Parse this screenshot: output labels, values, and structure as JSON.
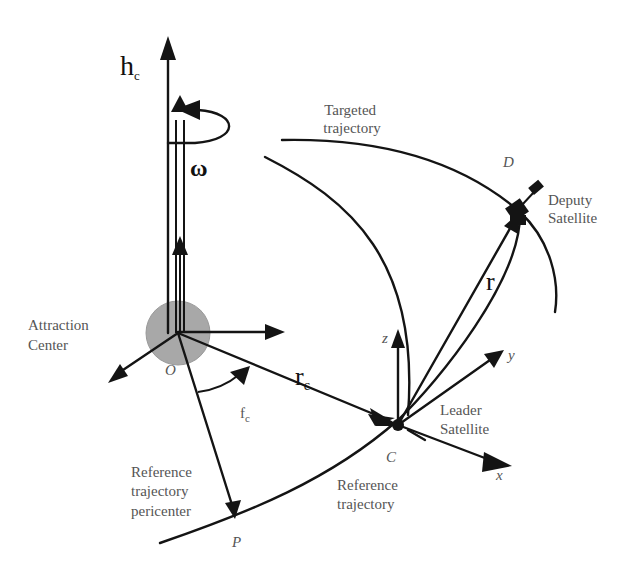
{
  "diagram": {
    "colors": {
      "ink": "#141414",
      "label_text": "#555555",
      "attraction_body_fill": "#a8a8a8",
      "background": "#ffffff"
    },
    "labels": {
      "h_c": {
        "main": "h",
        "sub": "c"
      },
      "omega": "ω",
      "targeted_trajectory": [
        "Targeted",
        "trajectory"
      ],
      "point_D": "D",
      "deputy_satellite": [
        "Deputy",
        "Satellite"
      ],
      "r": "r",
      "attraction_center": [
        "Attraction",
        "Center"
      ],
      "point_O": "O",
      "r_c": {
        "main": "r",
        "sub": "c"
      },
      "f_c": {
        "main": "f",
        "sub": "c"
      },
      "axis_z": "z",
      "axis_y": "y",
      "axis_x": "x",
      "leader_satellite": [
        "Leader",
        "Satellite"
      ],
      "point_C": "C",
      "reference_trajectory": [
        "Reference",
        "trajectory"
      ],
      "reference_pericenter": [
        "Reference",
        "trajectory",
        "pericenter"
      ],
      "point_P": "P"
    },
    "nodes": [
      {
        "id": "O",
        "label": "Attraction Center",
        "shape": "circle"
      },
      {
        "id": "C",
        "label": "Leader Satellite"
      },
      {
        "id": "D",
        "label": "Deputy Satellite"
      },
      {
        "id": "P",
        "label": "Reference trajectory pericenter"
      }
    ],
    "edges": [
      {
        "from": "O",
        "to": "C",
        "label": "r_c"
      },
      {
        "from": "C",
        "to": "D",
        "label": "r"
      },
      {
        "from": "O",
        "to": "P",
        "label": ""
      },
      {
        "from": "O",
        "to": "up",
        "label": "h_c"
      },
      {
        "from": "O",
        "to": "up",
        "label": "ω"
      }
    ]
  }
}
